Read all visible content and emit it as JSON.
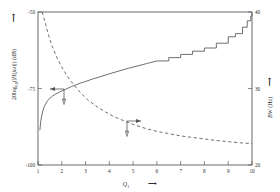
{
  "chart_data": {
    "type": "line",
    "title": "",
    "xlabel": "Q1",
    "xlabel_arrow": "⟶",
    "ylabel_left": "20log10(|H(jω)|) (dB)",
    "ylabel_left_arrow": "⟶",
    "ylabel_right": "BW (Hz)",
    "ylabel_right_arrow": "⟶",
    "xlim": [
      1,
      10
    ],
    "ylim_left": [
      -100,
      -50
    ],
    "ylim_right": [
      20,
      40
    ],
    "grid": false,
    "legend": "none",
    "xticks": [
      "1",
      "2",
      "3",
      "4",
      "5",
      "6",
      "7",
      "8",
      "9",
      "10"
    ],
    "xtick_values": [
      1,
      2,
      3,
      4,
      5,
      6,
      7,
      8,
      9,
      10
    ],
    "yticks_left": [
      "-50",
      "-75",
      "-100"
    ],
    "ytick_left_values": [
      -50,
      -75,
      -100
    ],
    "yticks_right": [
      "40",
      "30",
      "20"
    ],
    "ytick_right_values": [
      40,
      30,
      20
    ],
    "series": [
      {
        "name": "magnitude-response",
        "style": "solid",
        "axis": "left",
        "color": "#4a4a4a",
        "annotation_arrow": "left",
        "x": [
          1.08,
          1.12,
          1.18,
          1.25,
          1.32,
          1.4,
          1.5,
          1.62,
          1.75,
          1.9,
          2.05,
          2.2,
          2.4,
          2.6,
          2.8,
          3.0,
          3.3,
          3.6,
          4.0,
          4.4,
          4.8,
          5.2,
          5.6,
          6.0,
          6.5,
          7.0,
          7.5,
          8.0,
          8.5,
          9.0,
          9.3,
          9.6,
          9.8,
          9.95,
          10.0
        ],
        "y": [
          -88.5,
          -85.5,
          -83.0,
          -81.2,
          -80.0,
          -79.0,
          -78.2,
          -77.4,
          -76.8,
          -76.2,
          -75.6,
          -75.1,
          -74.4,
          -73.8,
          -73.2,
          -72.7,
          -71.9,
          -71.2,
          -70.2,
          -69.3,
          -68.4,
          -67.6,
          -66.8,
          -66.0,
          -65.0,
          -64.0,
          -62.9,
          -61.7,
          -60.2,
          -58.3,
          -56.8,
          -54.8,
          -53.0,
          -51.2,
          -50.0
        ]
      },
      {
        "name": "bandwidth-curve",
        "style": "dashed",
        "axis": "right",
        "color": "#4a4a4a",
        "annotation_arrow": "right",
        "x": [
          1.18,
          1.3,
          1.45,
          1.6,
          1.8,
          2.0,
          2.25,
          2.5,
          2.8,
          3.1,
          3.4,
          3.8,
          4.2,
          4.6,
          5.0,
          5.5,
          6.0,
          6.5,
          7.0,
          7.5,
          8.0,
          8.5,
          9.0,
          9.5,
          10.0
        ],
        "y": [
          40.0,
          38.6,
          36.9,
          35.5,
          34.0,
          32.8,
          31.5,
          30.5,
          29.4,
          28.5,
          27.8,
          27.0,
          26.3,
          25.8,
          25.3,
          24.8,
          24.4,
          24.1,
          23.8,
          23.6,
          23.4,
          23.2,
          23.05,
          22.9,
          22.8
        ]
      }
    ],
    "annotations": [
      {
        "name": "left-axis-pointer",
        "direction": "left",
        "description": "arrow from solid curve pointing to left axis"
      },
      {
        "name": "right-axis-pointer",
        "direction": "right",
        "description": "arrow from dashed curve pointing to right axis"
      }
    ]
  }
}
